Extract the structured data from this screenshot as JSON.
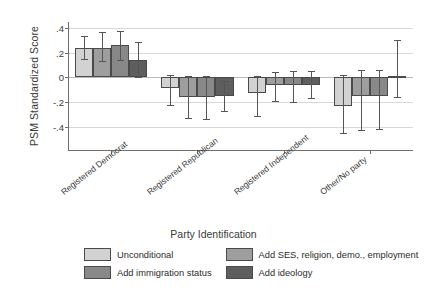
{
  "chart_data": {
    "type": "bar",
    "title": "",
    "xlabel": "Party Identification",
    "ylabel": "PSM Standardized Score",
    "ylim": [
      -0.5,
      0.45
    ],
    "yticks": [
      0.4,
      0.2,
      0,
      -0.2,
      -0.4
    ],
    "ytick_labels": [
      ".4",
      ".2",
      "0",
      "-.2",
      "-.4"
    ],
    "grid": true,
    "legend_position": "bottom",
    "orientation": "vertical",
    "error_bars": "95% confidence interval",
    "categories": [
      "Registered Democrat",
      "Registered Republican",
      "Registered Independent",
      "Other/No party"
    ],
    "series": [
      {
        "name": "Unconditional",
        "color": "#d2d2d2",
        "values": [
          0.24,
          -0.09,
          -0.13,
          -0.23
        ],
        "ci_low": [
          0.15,
          -0.22,
          -0.31,
          -0.45
        ],
        "ci_high": [
          0.34,
          0.02,
          0.01,
          0.02
        ]
      },
      {
        "name": "Add SES, religion, demo., employment",
        "color": "#9e9e9e",
        "values": [
          0.24,
          -0.16,
          -0.06,
          -0.15
        ],
        "ci_low": [
          0.13,
          -0.33,
          -0.19,
          -0.43
        ],
        "ci_high": [
          0.37,
          0.01,
          0.04,
          0.06
        ]
      },
      {
        "name": "Add immigration status",
        "color": "#888888",
        "values": [
          0.26,
          -0.16,
          -0.06,
          -0.15
        ],
        "ci_low": [
          0.14,
          -0.34,
          -0.2,
          -0.42
        ],
        "ci_high": [
          0.38,
          0.01,
          0.05,
          0.06
        ]
      },
      {
        "name": "Add ideology",
        "color": "#5e5e5e",
        "values": [
          0.14,
          -0.15,
          -0.06,
          0.01
        ],
        "ci_low": [
          0.0,
          -0.27,
          -0.17,
          -0.16
        ],
        "ci_high": [
          0.29,
          -0.03,
          0.05,
          0.3
        ]
      }
    ]
  },
  "axis": {
    "y_title": "PSM Standardized Score",
    "x_title": "Party Identification"
  },
  "legend": {
    "items": [
      {
        "label": "Unconditional"
      },
      {
        "label": "Add SES, religion, demo., employment"
      },
      {
        "label": "Add immigration status"
      },
      {
        "label": "Add ideology"
      }
    ]
  }
}
